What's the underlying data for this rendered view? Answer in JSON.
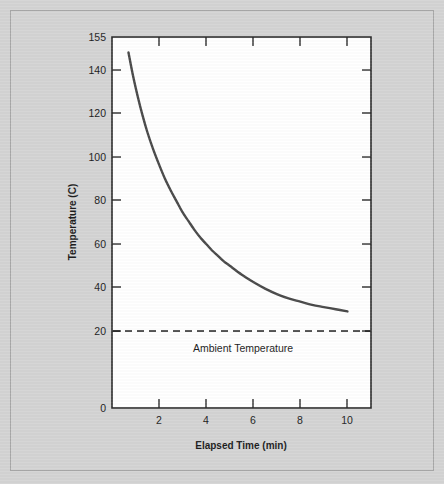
{
  "figure": {
    "background_color": "#d4d4d4",
    "plot_background_color": "#ffffff",
    "frame_color": "#2b2b2b",
    "border_color": "#a8a8a8"
  },
  "chart_data": {
    "type": "line",
    "title": "",
    "subtitle": "",
    "xlabel": "Elapsed Time (min)",
    "ylabel": "Temperature (C)",
    "xlim": [
      0,
      11
    ],
    "ylim": [
      0,
      155
    ],
    "grid": false,
    "legend": "none",
    "line_color": "#4a4a4a",
    "line_width": 2.4,
    "xticks": [
      2,
      4,
      6,
      8,
      10
    ],
    "xticklabels": [
      "2",
      "4",
      "6",
      "8",
      "10"
    ],
    "yticks": [
      0,
      20,
      40,
      60,
      80,
      100,
      120,
      140,
      155
    ],
    "yticklabels": [
      "0",
      "20",
      "40",
      "60",
      "80",
      "100",
      "120",
      "140",
      "155"
    ],
    "y_axis_note": "Non-linear axis break between 0 and 20; 20-140 evenly spaced; 155 at top of frame",
    "series": [
      {
        "name": "Cooling curve",
        "x": [
          0.7,
          0.9,
          1.1,
          1.3,
          1.5,
          1.75,
          2.0,
          2.25,
          2.5,
          2.75,
          3.0,
          3.25,
          3.5,
          3.75,
          4.0,
          4.25,
          4.5,
          4.75,
          5.0,
          5.5,
          6.0,
          6.5,
          7.0,
          7.5,
          8.0,
          8.5,
          9.0,
          9.5,
          10.0
        ],
        "y": [
          148.0,
          137.0,
          127.5,
          119.0,
          111.5,
          103.5,
          96.5,
          90.0,
          84.5,
          79.5,
          74.5,
          70.5,
          66.5,
          63.0,
          60.0,
          57.0,
          54.5,
          52.0,
          50.0,
          46.0,
          42.5,
          39.5,
          37.0,
          35.0,
          33.5,
          32.0,
          31.0,
          30.0,
          29.0
        ]
      }
    ],
    "annotations": [
      {
        "name": "ambient-temperature-line",
        "type": "hline",
        "value": 20,
        "label": "Ambient Temperature",
        "style": "dashed",
        "color": "#1d1d1d"
      }
    ]
  }
}
